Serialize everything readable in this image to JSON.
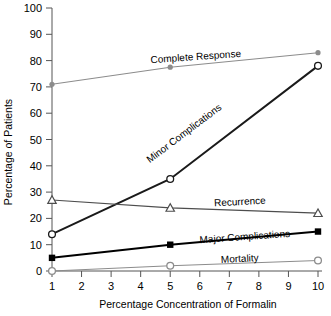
{
  "chart_data": {
    "type": "line",
    "title": "",
    "xlabel": "Percentage Concentration of Formalin",
    "ylabel": "Percentage of Patients",
    "x": [
      1,
      5,
      10
    ],
    "xlim": [
      0.5,
      10.5
    ],
    "ylim": [
      0,
      100
    ],
    "xticks": [
      "1",
      "2",
      "3",
      "4",
      "5",
      "6",
      "7",
      "8",
      "9",
      "10"
    ],
    "yticks": [
      "0",
      "10",
      "20",
      "30",
      "40",
      "50",
      "60",
      "70",
      "80",
      "90",
      "100"
    ],
    "grid": false,
    "legend": "inline-labels",
    "series": [
      {
        "name": "Complete Response",
        "values": [
          71,
          77.5,
          83
        ],
        "color": "#8c8c8c",
        "marker": "filled-circle",
        "label": "Complete Response"
      },
      {
        "name": "Minor Complications",
        "values": [
          14,
          35,
          78
        ],
        "color": "#1a1a1a",
        "marker": "open-circle",
        "label": "Minor Complications"
      },
      {
        "name": "Recurrence",
        "values": [
          27,
          24,
          22
        ],
        "color": "#4d4d4d",
        "marker": "open-triangle",
        "label": "Recurrence"
      },
      {
        "name": "Major Complications",
        "values": [
          5,
          10,
          15
        ],
        "color": "#000000",
        "marker": "filled-square",
        "label": "Major Complications"
      },
      {
        "name": "Mortality",
        "values": [
          0,
          2,
          4
        ],
        "color": "#8c8c8c",
        "marker": "open-circle",
        "label": "Mortality"
      }
    ]
  },
  "axes": {
    "y_title": "Percentage of Patients",
    "x_title": "Percentage Concentration of Formalin",
    "y_ticks": [
      "100",
      "90",
      "80",
      "70",
      "60",
      "50",
      "40",
      "30",
      "20",
      "10",
      "0"
    ],
    "x_ticks": [
      "1",
      "2",
      "3",
      "4",
      "5",
      "6",
      "7",
      "8",
      "9",
      "10"
    ]
  },
  "labels": {
    "complete_response": "Complete Response",
    "minor_complications": "Minor Complications",
    "recurrence": "Recurrence",
    "major_complications": "Major Complications",
    "mortality": "Mortality"
  }
}
